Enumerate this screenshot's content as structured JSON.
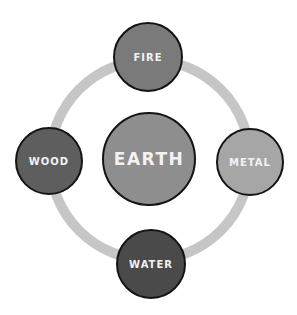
{
  "diagram": {
    "type": "five-elements-cycle",
    "ring_color": "#c6c6c6",
    "center": {
      "label": "EARTH",
      "color": "#8e8e8e"
    },
    "nodes": [
      {
        "id": "fire",
        "label": "FIRE",
        "position": "top",
        "color": "#7a7a7a"
      },
      {
        "id": "metal",
        "label": "METAL",
        "position": "right",
        "color": "#a6a6a6"
      },
      {
        "id": "water",
        "label": "WATER",
        "position": "bottom",
        "color": "#4a4a4a"
      },
      {
        "id": "wood",
        "label": "WOOD",
        "position": "left",
        "color": "#5e5e5e"
      }
    ]
  }
}
